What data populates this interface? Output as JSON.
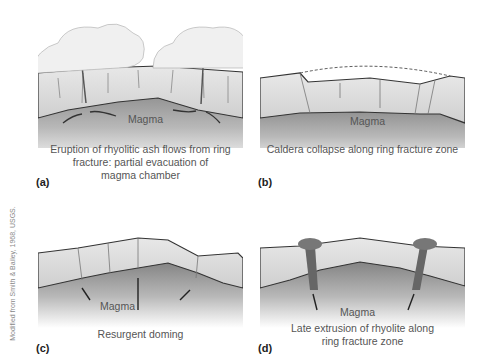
{
  "figure": {
    "credit": "Modified from Smith & Bailey, 1968, USGS.",
    "panels": [
      {
        "id": "a",
        "label": "(a)",
        "magma_label": "Magma",
        "caption_lines": [
          "Eruption of rhyolitic ash flows from ring",
          "fracture: partial evacuation of",
          "magma chamber"
        ]
      },
      {
        "id": "b",
        "label": "(b)",
        "magma_label": "Magma",
        "caption_lines": [
          "Caldera collapse along ring fracture zone"
        ]
      },
      {
        "id": "c",
        "label": "(c)",
        "magma_label": "Magma",
        "caption_lines": [
          "Resurgent doming"
        ]
      },
      {
        "id": "d",
        "label": "(d)",
        "magma_label": "Magma",
        "caption_lines": [
          "Late extrusion of rhyolite along",
          "ring fracture zone"
        ]
      }
    ]
  }
}
